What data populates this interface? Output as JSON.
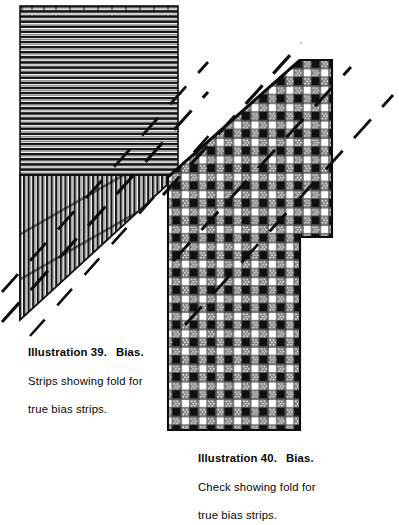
{
  "page": {
    "background_color": "#ffffff",
    "ink_color": "#101010",
    "width": 399,
    "height": 483
  },
  "figures": [
    {
      "id": "illustration-39",
      "number": "39",
      "subject": "Bias",
      "fabric_type": "striped",
      "description": "Striped fabric square with lower corner folded back, diagonal fold line marked by dashes",
      "parts": {
        "upper_piece": "horizontal-stripes",
        "folded_piece": "vertical-stripes",
        "fold_marker": "dashed-diagonal-line"
      }
    },
    {
      "id": "illustration-40",
      "number": "40",
      "subject": "Bias",
      "fabric_type": "check",
      "description": "Checked gingham fabric with corner folded back on the true bias, diagonal fold marked by dashes",
      "parts": {
        "body": "check-weave",
        "fold_marker": "dashed-diagonal-line"
      }
    }
  ],
  "captions": {
    "illustration_39": {
      "label": "Illustration 39.",
      "subject": "Bias.",
      "line2": "Strips showing fold for",
      "line3": "true bias strips."
    },
    "illustration_40": {
      "label": "Illustration 40.",
      "subject": "Bias.",
      "line2": "Check showing fold for",
      "line3": "true bias strips."
    }
  },
  "fold_lines": {
    "count_left": 3,
    "count_right": 3,
    "style": "dashed",
    "angle_degrees": -42
  }
}
